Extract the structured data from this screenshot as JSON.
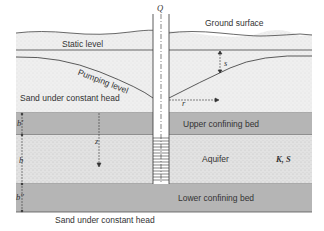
{
  "diagram": {
    "labels": {
      "discharge": "Q",
      "ground_surface": "Ground surface",
      "static_level": "Static level",
      "pumping_level": "Pumping level",
      "drawdown": "s",
      "radius": "r",
      "upper_sand": "Sand under constant head",
      "upper_confining": "Upper confining bed",
      "aquifer": "Aquifer",
      "aquifer_params": "K, S",
      "lower_confining": "Lower confining bed",
      "lower_sand": "Sand under constant head",
      "thickness_upper": "b'",
      "thickness_aquifer": "b",
      "thickness_lower": "b''",
      "depth": "z"
    },
    "colors": {
      "confining_bed": "#b4b4b4",
      "sand": "#ececec",
      "aquifer": "#dedede",
      "line": "#333333"
    }
  }
}
